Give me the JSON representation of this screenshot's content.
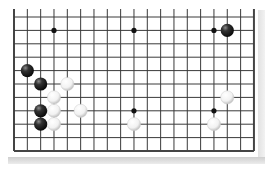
{
  "board": {
    "columns": 19,
    "visible_rows": 11,
    "origin_x": 14,
    "origin_y": 17,
    "spacing_x": 13.33,
    "spacing_y": 13.4,
    "edges": {
      "left": true,
      "right": true,
      "bottom": true,
      "top": false
    },
    "line_color": "#3a3a3a",
    "edge_color": "#444444",
    "background": "#ffffff"
  },
  "star_points": [
    {
      "col": 3,
      "row": 1
    },
    {
      "col": 9,
      "row": 1
    },
    {
      "col": 15,
      "row": 1
    },
    {
      "col": 9,
      "row": 7
    },
    {
      "col": 15,
      "row": 7
    }
  ],
  "stones": [
    {
      "color": "black",
      "col": 16,
      "row": 1
    },
    {
      "color": "black",
      "col": 1,
      "row": 4
    },
    {
      "color": "black",
      "col": 2,
      "row": 5
    },
    {
      "color": "white",
      "col": 4,
      "row": 5
    },
    {
      "color": "white",
      "col": 3,
      "row": 6
    },
    {
      "color": "white",
      "col": 16,
      "row": 6
    },
    {
      "color": "black",
      "col": 2,
      "row": 7
    },
    {
      "color": "white",
      "col": 3,
      "row": 7
    },
    {
      "color": "white",
      "col": 5,
      "row": 7
    },
    {
      "color": "black",
      "col": 2,
      "row": 8
    },
    {
      "color": "white",
      "col": 3,
      "row": 8
    },
    {
      "color": "white",
      "col": 9,
      "row": 8
    },
    {
      "color": "white",
      "col": 15,
      "row": 8
    }
  ]
}
